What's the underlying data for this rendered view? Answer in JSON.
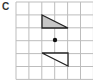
{
  "figure": {
    "label": "C",
    "grid": {
      "x0": 16,
      "y0": 2,
      "cell": 12.9,
      "cols": 6,
      "rows": 6,
      "line_color": "#bdbdbd"
    },
    "center_point": {
      "x": 55,
      "y": 40,
      "r": 2.2,
      "color": "#111111"
    },
    "shapes": [
      {
        "name": "original-triangle",
        "points": "42,15 42,28 68,28",
        "fill": "#c6c6c6",
        "stroke": "#222222"
      },
      {
        "name": "image-triangle",
        "points": "42,53 68,53 68,66",
        "fill": "#ffffff",
        "stroke": "#222222"
      }
    ]
  }
}
